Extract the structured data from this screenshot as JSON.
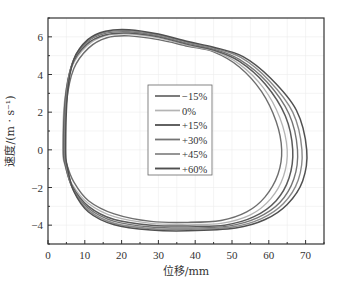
{
  "chart_data": {
    "type": "line",
    "title": "",
    "xlabel": "位移/mm",
    "ylabel": "速度/(m · s⁻¹)",
    "xlim": [
      0,
      75
    ],
    "ylim": [
      -5,
      7
    ],
    "xticks": [
      0,
      10,
      20,
      30,
      40,
      50,
      60,
      70
    ],
    "yticks": [
      -4,
      -2,
      0,
      2,
      4,
      6
    ],
    "grid": true,
    "legend_position": "center",
    "series": [
      {
        "name": "−15%",
        "color": "#6e6e6e",
        "width": 1.4,
        "points": [
          [
            4.5,
            0
          ],
          [
            5,
            2.5
          ],
          [
            7,
            4.3
          ],
          [
            11,
            5.4
          ],
          [
            16,
            5.95
          ],
          [
            22,
            6.05
          ],
          [
            30,
            5.85
          ],
          [
            38,
            5.5
          ],
          [
            45,
            5.2
          ],
          [
            52,
            4.4
          ],
          [
            58,
            3.1
          ],
          [
            62,
            1.5
          ],
          [
            63.5,
            0
          ],
          [
            62.5,
            -1.3
          ],
          [
            59,
            -2.5
          ],
          [
            54,
            -3.3
          ],
          [
            47,
            -3.75
          ],
          [
            38,
            -3.85
          ],
          [
            28,
            -3.8
          ],
          [
            18,
            -3.4
          ],
          [
            11,
            -2.7
          ],
          [
            7,
            -1.7
          ],
          [
            5,
            -0.7
          ]
        ]
      },
      {
        "name": "0%",
        "color": "#b4b4b4",
        "width": 1.3,
        "points": [
          [
            4.0,
            0
          ],
          [
            4.5,
            2.6
          ],
          [
            6.5,
            4.4
          ],
          [
            10.5,
            5.5
          ],
          [
            15.5,
            6.05
          ],
          [
            22,
            6.15
          ],
          [
            30,
            5.95
          ],
          [
            38,
            5.55
          ],
          [
            45,
            5.25
          ],
          [
            52,
            4.55
          ],
          [
            58.5,
            3.3
          ],
          [
            63,
            1.7
          ],
          [
            65,
            0
          ],
          [
            64,
            -1.4
          ],
          [
            60.5,
            -2.6
          ],
          [
            55,
            -3.45
          ],
          [
            47,
            -3.9
          ],
          [
            38,
            -3.95
          ],
          [
            28,
            -3.9
          ],
          [
            18,
            -3.55
          ],
          [
            11,
            -2.85
          ],
          [
            6.5,
            -1.8
          ],
          [
            4.5,
            -0.75
          ]
        ]
      },
      {
        "name": "+15%",
        "color": "#5a5a5a",
        "width": 1.5,
        "points": [
          [
            4.2,
            0
          ],
          [
            4.7,
            2.7
          ],
          [
            6.5,
            4.5
          ],
          [
            10.5,
            5.6
          ],
          [
            15.5,
            6.1
          ],
          [
            22,
            6.2
          ],
          [
            30,
            6.0
          ],
          [
            38,
            5.6
          ],
          [
            45,
            5.3
          ],
          [
            52,
            4.7
          ],
          [
            59,
            3.5
          ],
          [
            64.5,
            1.8
          ],
          [
            66.5,
            0
          ],
          [
            65.5,
            -1.5
          ],
          [
            62,
            -2.7
          ],
          [
            56,
            -3.55
          ],
          [
            48,
            -4.0
          ],
          [
            38,
            -4.05
          ],
          [
            28,
            -4.0
          ],
          [
            18,
            -3.7
          ],
          [
            11,
            -3.0
          ],
          [
            6.5,
            -1.9
          ],
          [
            4.7,
            -0.8
          ]
        ]
      },
      {
        "name": "+30%",
        "color": "#747474",
        "width": 1.4,
        "points": [
          [
            4.4,
            0
          ],
          [
            4.9,
            2.8
          ],
          [
            6.6,
            4.6
          ],
          [
            10.5,
            5.7
          ],
          [
            15.5,
            6.18
          ],
          [
            22,
            6.27
          ],
          [
            30,
            6.05
          ],
          [
            38,
            5.65
          ],
          [
            45,
            5.35
          ],
          [
            52,
            4.8
          ],
          [
            59.5,
            3.6
          ],
          [
            65.5,
            1.9
          ],
          [
            67.8,
            0
          ],
          [
            66.8,
            -1.55
          ],
          [
            63,
            -2.8
          ],
          [
            57,
            -3.6
          ],
          [
            49,
            -4.05
          ],
          [
            38,
            -4.15
          ],
          [
            28,
            -4.1
          ],
          [
            18,
            -3.8
          ],
          [
            11,
            -3.1
          ],
          [
            6.6,
            -2.0
          ],
          [
            4.9,
            -0.85
          ]
        ]
      },
      {
        "name": "+45%",
        "color": "#8a8a8a",
        "width": 1.4,
        "points": [
          [
            4.6,
            0
          ],
          [
            5.1,
            2.9
          ],
          [
            6.8,
            4.7
          ],
          [
            10.6,
            5.78
          ],
          [
            15.5,
            6.24
          ],
          [
            22,
            6.32
          ],
          [
            30,
            6.1
          ],
          [
            38,
            5.7
          ],
          [
            45,
            5.4
          ],
          [
            52.5,
            4.9
          ],
          [
            60,
            3.7
          ],
          [
            66.5,
            2.0
          ],
          [
            69,
            0
          ],
          [
            68,
            -1.6
          ],
          [
            64,
            -2.85
          ],
          [
            58,
            -3.65
          ],
          [
            50,
            -4.1
          ],
          [
            38,
            -4.22
          ],
          [
            28,
            -4.18
          ],
          [
            18,
            -3.9
          ],
          [
            11,
            -3.2
          ],
          [
            6.8,
            -2.1
          ],
          [
            5.1,
            -0.9
          ]
        ]
      },
      {
        "name": "+60%",
        "color": "#505050",
        "width": 1.5,
        "points": [
          [
            4.8,
            0
          ],
          [
            5.3,
            3.0
          ],
          [
            7.0,
            4.8
          ],
          [
            10.8,
            5.85
          ],
          [
            15.6,
            6.3
          ],
          [
            22,
            6.38
          ],
          [
            30,
            6.15
          ],
          [
            38,
            5.75
          ],
          [
            45,
            5.45
          ],
          [
            53,
            4.95
          ],
          [
            60.5,
            3.8
          ],
          [
            67.5,
            2.1
          ],
          [
            70.3,
            0
          ],
          [
            69.2,
            -1.65
          ],
          [
            65,
            -2.9
          ],
          [
            59,
            -3.7
          ],
          [
            51,
            -4.15
          ],
          [
            38,
            -4.3
          ],
          [
            28,
            -4.26
          ],
          [
            18,
            -3.98
          ],
          [
            11,
            -3.3
          ],
          [
            7.0,
            -2.2
          ],
          [
            5.3,
            -0.95
          ]
        ]
      }
    ]
  }
}
